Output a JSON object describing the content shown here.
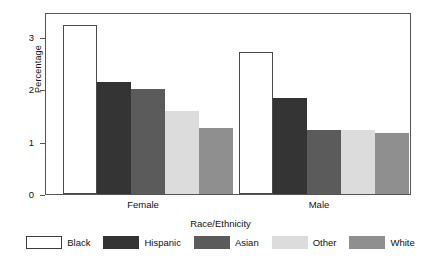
{
  "chart_data": {
    "type": "bar",
    "title": "",
    "xlabel": "Race/Ethnicity",
    "ylabel": "Percentage",
    "categories": [
      "Female",
      "Male"
    ],
    "ylim": [
      0,
      3.47
    ],
    "yticks": [
      0,
      1,
      2,
      3
    ],
    "ytick_labels": [
      "0",
      "1",
      "2",
      "3"
    ],
    "grid": false,
    "legend_position": "bottom",
    "series": [
      {
        "name": "Black",
        "color": "#ffffff",
        "values": [
          3.25,
          2.74
        ]
      },
      {
        "name": "Hispanic",
        "color": "#343434",
        "values": [
          2.15,
          1.85
        ]
      },
      {
        "name": "Asian",
        "color": "#5b5b5b",
        "values": [
          2.03,
          1.23
        ]
      },
      {
        "name": "Other",
        "color": "#dcdcdc",
        "values": [
          1.6,
          1.23
        ]
      },
      {
        "name": "White",
        "color": "#8f8f8f",
        "values": [
          1.28,
          1.18
        ]
      }
    ]
  },
  "axes": {
    "y_title": "Percentage",
    "x_title": "Race/Ethnicity",
    "y_tick_0": "0",
    "y_tick_1": "1",
    "y_tick_2": "2",
    "y_tick_3": "3",
    "group_0": "Female",
    "group_1": "Male"
  },
  "legend": {
    "items": [
      {
        "label": "Black",
        "swatch": "swatch-black"
      },
      {
        "label": "Hispanic",
        "swatch": "swatch-hispanic"
      },
      {
        "label": "Asian",
        "swatch": "swatch-asian"
      },
      {
        "label": "Other",
        "swatch": "swatch-other"
      },
      {
        "label": "White",
        "swatch": "swatch-white"
      }
    ]
  }
}
